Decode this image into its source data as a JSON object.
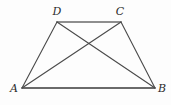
{
  "figure": {
    "kind": "geometry-diagram",
    "canvas": {
      "width": 171,
      "height": 105
    },
    "background_color": "#fdfdfd",
    "colors": {
      "edge_base": "#3a3a3a",
      "edge_top": "#8e8e8e",
      "edge_side": "#4a4a4a",
      "diagonal": "#4a4a4a",
      "label": "#2b2b2b"
    },
    "points": [
      {
        "id": "A",
        "label": "A",
        "x": 22,
        "y": 88,
        "label_x": 14,
        "label_y": 88
      },
      {
        "id": "B",
        "label": "B",
        "x": 155,
        "y": 88,
        "label_x": 162,
        "label_y": 88
      },
      {
        "id": "C",
        "label": "C",
        "x": 121,
        "y": 22,
        "label_x": 120,
        "label_y": 11
      },
      {
        "id": "D",
        "label": "D",
        "x": 57,
        "y": 22,
        "label_x": 57,
        "label_y": 11
      }
    ],
    "segments": [
      {
        "id": "AB",
        "name": "segment-ab",
        "from": "A",
        "to": "B",
        "color": "#3a3a3a",
        "width": 1.5
      },
      {
        "id": "DC",
        "name": "segment-dc",
        "from": "D",
        "to": "C",
        "color": "#8e8e8e",
        "width": 1.9
      },
      {
        "id": "AD",
        "name": "segment-ad",
        "from": "A",
        "to": "D",
        "color": "#4a4a4a",
        "width": 1.1
      },
      {
        "id": "CB",
        "name": "segment-cb",
        "from": "C",
        "to": "B",
        "color": "#4a4a4a",
        "width": 1.1
      },
      {
        "id": "AC",
        "name": "diagonal-ac",
        "from": "A",
        "to": "C",
        "color": "#4a4a4a",
        "width": 1.1
      },
      {
        "id": "DB",
        "name": "diagonal-db",
        "from": "D",
        "to": "B",
        "color": "#4a4a4a",
        "width": 1.1
      }
    ],
    "intersection": {
      "id": "P",
      "x": 90,
      "y": 44,
      "label": ""
    }
  }
}
